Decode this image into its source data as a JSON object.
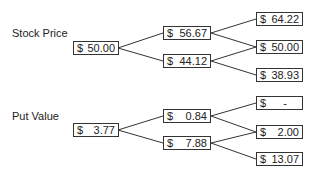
{
  "stock_tree": {
    "title": "Stock Price",
    "currency": "$",
    "nodes": [
      {
        "id": "s0",
        "value": "50.00"
      },
      {
        "id": "su",
        "value": "56.67"
      },
      {
        "id": "sd",
        "value": "44.12"
      },
      {
        "id": "suu",
        "value": "64.22"
      },
      {
        "id": "sud",
        "value": "50.00"
      },
      {
        "id": "sdd",
        "value": "38.93"
      }
    ]
  },
  "put_tree": {
    "title": "Put Value",
    "currency": "$",
    "nodes": [
      {
        "id": "p0",
        "value": "3.77"
      },
      {
        "id": "pu",
        "value": "0.84"
      },
      {
        "id": "pd",
        "value": "7.88"
      },
      {
        "id": "puu",
        "value": "-"
      },
      {
        "id": "pud",
        "value": "2.00"
      },
      {
        "id": "pdd",
        "value": "13.07"
      }
    ]
  }
}
